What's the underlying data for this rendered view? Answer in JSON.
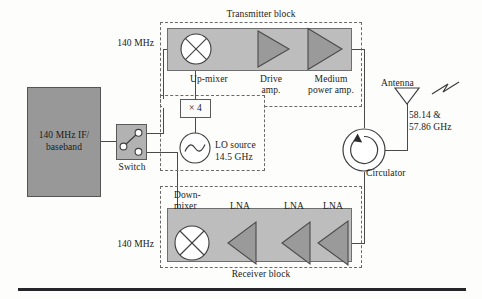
{
  "diagram": {
    "title_transmitter": "Transmitter block",
    "title_receiver": "Receiver block"
  },
  "if_block": {
    "line1": "140 MHz IF/",
    "line2": "baseband"
  },
  "switch": {
    "label": "Switch"
  },
  "signals": {
    "if_top": "140 MHz",
    "if_bottom": "140 MHz"
  },
  "transmitter": {
    "mixer_label": "Up-mixer",
    "drive_amp_line1": "Drive",
    "drive_amp_line2": "amp.",
    "power_amp_line1": "Medium",
    "power_amp_line2": "power amp."
  },
  "lo": {
    "multiplier": "× 4",
    "source_line1": "LO source",
    "source_line2": "14.5 GHz"
  },
  "receiver": {
    "mixer_line1": "Down-",
    "mixer_line2": "mixer",
    "lna_1": "LNA",
    "lna_2": "LNA",
    "lna_3": "LNA"
  },
  "antenna": {
    "label": "Antenna",
    "freq_line1": "58.14 &",
    "freq_line2": "57.86 GHz"
  },
  "circulator": {
    "label": "Circulator"
  },
  "colors": {
    "if_block_fill": "#989898",
    "strip_fill": "#bdbdbd",
    "amp_fill": "#9a9a9a",
    "line": "#4a4a4a",
    "text": "#1a1a1a"
  }
}
